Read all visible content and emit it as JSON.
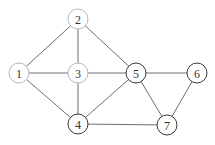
{
  "graph": {
    "nodes": [
      {
        "id": "1",
        "label": "1",
        "x": 19,
        "y": 73,
        "style": "light"
      },
      {
        "id": "2",
        "label": "2",
        "x": 78,
        "y": 19,
        "style": "light"
      },
      {
        "id": "3",
        "label": "3",
        "x": 78,
        "y": 73,
        "style": "light"
      },
      {
        "id": "4",
        "label": "4",
        "x": 78,
        "y": 124,
        "style": "dark"
      },
      {
        "id": "5",
        "label": "5",
        "x": 136,
        "y": 73,
        "style": "dark"
      },
      {
        "id": "6",
        "label": "6",
        "x": 197,
        "y": 73,
        "style": "dark"
      },
      {
        "id": "7",
        "label": "7",
        "x": 167,
        "y": 125,
        "style": "dark"
      }
    ],
    "edges": [
      [
        "1",
        "2"
      ],
      [
        "1",
        "3"
      ],
      [
        "1",
        "4"
      ],
      [
        "2",
        "3"
      ],
      [
        "2",
        "5"
      ],
      [
        "3",
        "4"
      ],
      [
        "3",
        "5"
      ],
      [
        "4",
        "5"
      ],
      [
        "4",
        "7"
      ],
      [
        "5",
        "6"
      ],
      [
        "5",
        "7"
      ],
      [
        "6",
        "7"
      ]
    ],
    "node_radius": 10,
    "colors": {
      "edge": "#6e6e6e",
      "light_stroke": "#b8b8b8",
      "dark_stroke": "#3a3a3a",
      "label": "#333333"
    }
  }
}
